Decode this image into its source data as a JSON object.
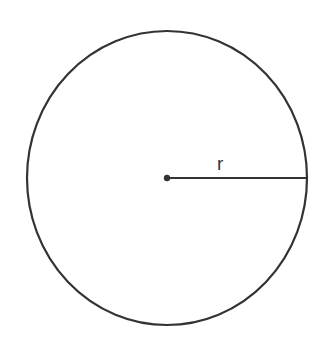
{
  "diagram": {
    "title": "",
    "shape": "circle",
    "radius_label": "r",
    "colors": {
      "stroke": "#333333",
      "background": "#ffffff"
    },
    "geometry": {
      "cx": 167,
      "cy": 178,
      "rx": 140,
      "ry": 147,
      "radius_end_x": 308
    }
  }
}
